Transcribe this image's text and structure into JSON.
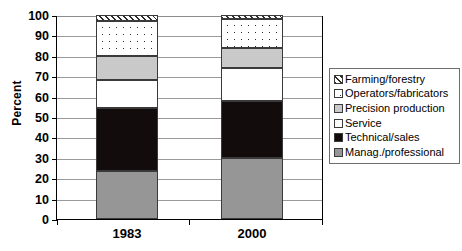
{
  "chart_data": {
    "type": "bar",
    "subtype": "stacked-bar-100-percent",
    "title": "",
    "xlabel": "",
    "ylabel": "Percent",
    "ylim": [
      0,
      100
    ],
    "yticks": [
      0,
      10,
      20,
      30,
      40,
      50,
      60,
      70,
      80,
      90,
      100
    ],
    "ytick_labels": [
      "0",
      "10",
      "20",
      "30",
      "40",
      "50",
      "60",
      "70",
      "80",
      "90",
      "100"
    ],
    "grid": true,
    "grid_axis": "y",
    "legend_position": "right",
    "categories": [
      "1983",
      "2000"
    ],
    "series": [
      {
        "name": "Manag./professional",
        "values": [
          23.5,
          30.0
        ],
        "color": "#969696",
        "pattern": "solid"
      },
      {
        "name": "Technical/sales",
        "values": [
          31.0,
          28.0
        ],
        "color": "#120c0c",
        "pattern": "solid"
      },
      {
        "name": "Service",
        "values": [
          13.5,
          16.0
        ],
        "color": "#ffffff",
        "pattern": "solid"
      },
      {
        "name": "Precision production",
        "values": [
          12.0,
          10.0
        ],
        "color": "#c9c9c9",
        "pattern": "solid"
      },
      {
        "name": "Operators/fabricators",
        "values": [
          17.0,
          14.0
        ],
        "color": "#ffffff",
        "pattern": "dots"
      },
      {
        "name": "Farming/forestry",
        "values": [
          3.0,
          2.0
        ],
        "color": "#ffffff",
        "pattern": "diagonal-hatch"
      }
    ],
    "stack_order_bottom_to_top": [
      "Manag./professional",
      "Technical/sales",
      "Service",
      "Precision production",
      "Operators/fabricators",
      "Farming/forestry"
    ],
    "cumulative_tops": {
      "1983": [
        23.5,
        54.5,
        68.0,
        80.0,
        97.0,
        100.0
      ],
      "2000": [
        30.0,
        58.0,
        74.0,
        84.0,
        98.0,
        100.0
      ]
    }
  },
  "legend": {
    "entries": [
      {
        "label": "Farming/forestry",
        "swatch": "diagonal-hatch-swatch"
      },
      {
        "label": "Operators/fabricators",
        "swatch": "dotted-swatch"
      },
      {
        "label": "Precision production",
        "swatch": "light-gray-swatch"
      },
      {
        "label": "Service",
        "swatch": "white-swatch"
      },
      {
        "label": "Technical/sales",
        "swatch": "black-swatch"
      },
      {
        "label": "Manag./professional",
        "swatch": "gray-swatch"
      }
    ]
  }
}
